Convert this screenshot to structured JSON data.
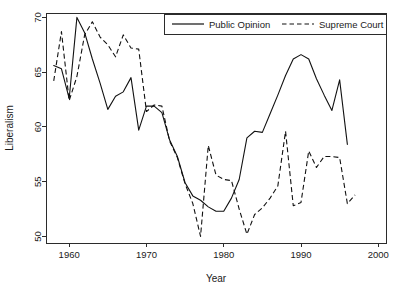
{
  "chart_data": {
    "type": "line",
    "title": "",
    "xlabel": "Year",
    "ylabel": "Liberalism",
    "xlim": [
      1957,
      2001
    ],
    "ylim": [
      49.4,
      70.4
    ],
    "xticks": [
      1960,
      1970,
      1980,
      1990,
      2000
    ],
    "yticks": [
      50,
      55,
      60,
      65,
      70
    ],
    "grid": false,
    "legend_position": "top-right",
    "x": [
      1958,
      1959,
      1960,
      1961,
      1962,
      1963,
      1964,
      1965,
      1966,
      1967,
      1968,
      1969,
      1970,
      1971,
      1972,
      1973,
      1974,
      1975,
      1976,
      1977,
      1978,
      1979,
      1980,
      1981,
      1982,
      1983,
      1984,
      1985,
      1986,
      1987,
      1988,
      1989,
      1990,
      1991,
      1992,
      1993,
      1994,
      1995,
      1996,
      1997
    ],
    "series": [
      {
        "name": "Public Opinion",
        "style": "solid",
        "values": [
          65.6,
          65.3,
          62.6,
          70.0,
          68.6,
          66.2,
          64.0,
          61.6,
          62.8,
          63.2,
          64.5,
          59.7,
          61.9,
          61.9,
          61.3,
          58.8,
          57.3,
          54.9,
          53.7,
          53.3,
          52.7,
          52.3,
          52.3,
          53.5,
          55.2,
          59.0,
          59.6,
          59.5,
          61.2,
          62.9,
          64.7,
          66.2,
          66.6,
          66.2,
          64.4,
          62.9,
          61.5,
          64.3,
          58.4,
          null
        ]
      },
      {
        "name": "Supreme Court",
        "style": "dashed",
        "values": [
          64.2,
          68.7,
          62.4,
          64.6,
          68.4,
          69.6,
          68.2,
          67.5,
          66.4,
          68.4,
          67.2,
          67.1,
          61.4,
          62.0,
          61.9,
          58.7,
          57.2,
          54.8,
          53.0,
          50.0,
          58.3,
          55.6,
          55.2,
          55.1,
          52.5,
          50.2,
          52.0,
          52.6,
          53.5,
          54.6,
          59.6,
          52.8,
          53.1,
          57.8,
          56.3,
          57.3,
          57.3,
          57.2,
          53.0,
          53.8
        ]
      }
    ]
  },
  "legend": {
    "entries": [
      {
        "label": "Public Opinion",
        "style": "solid"
      },
      {
        "label": "Supreme Court",
        "style": "dashed"
      }
    ]
  },
  "axes": {
    "x_title": "Year",
    "y_title": "Liberalism",
    "x_tick_labels": [
      "1960",
      "1970",
      "1980",
      "1990",
      "2000"
    ],
    "y_tick_labels": [
      "50",
      "55",
      "60",
      "65",
      "70"
    ]
  }
}
